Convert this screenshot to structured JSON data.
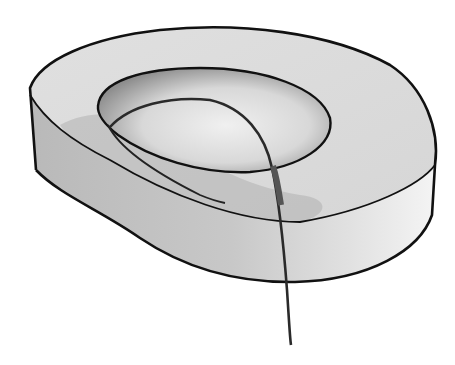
{
  "figure": {
    "kind": "illustration",
    "colors": {
      "background": "#ffffff",
      "outline": "#111111",
      "body_fill": "#d4d4d4",
      "body_shadow": "#9a9a9a",
      "inner_fill": "#e6e6e6",
      "tube": "#2a2a2a",
      "tube_sleeve": "#555555"
    }
  }
}
